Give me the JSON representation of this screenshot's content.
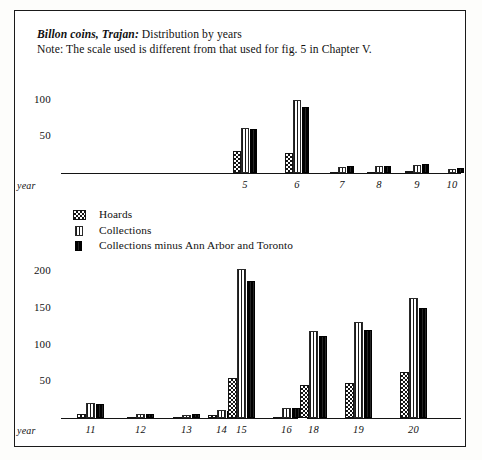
{
  "figure": {
    "title_italic": "Billon coins, Trajan:",
    "title_rest": " Distribution by years",
    "note": "Note: The scale used is different from that used for  fig. 5 in Chapter V."
  },
  "legend": {
    "items": [
      {
        "label": "Hoards",
        "pattern": "checkerboard",
        "color": "#151515"
      },
      {
        "label": "Collections",
        "pattern": "vertical-stripes",
        "color": "#1b1b1b"
      },
      {
        "label": "Collections minus Ann Arbor and Toronto",
        "pattern": "solid-dense",
        "color": "#101010"
      }
    ]
  },
  "axis_word": "year",
  "chart_data": [
    {
      "type": "bar",
      "title": "Billon coins, Trajan: Distribution by years (upper panel)",
      "panel": "upper",
      "xlabel": "year",
      "ylabel": "",
      "categories": [
        "5",
        "6",
        "7",
        "8",
        "9",
        "10"
      ],
      "yticks": [
        50,
        100
      ],
      "ylim": [
        0,
        115
      ],
      "grid": false,
      "legend_position": "below-panel",
      "series": [
        {
          "name": "Hoards",
          "values": [
            30,
            28,
            1,
            1,
            3,
            0
          ]
        },
        {
          "name": "Collections",
          "values": [
            62,
            100,
            8,
            9,
            11,
            6
          ]
        },
        {
          "name": "Collections minus Ann Arbor and Toronto",
          "values": [
            60,
            90,
            9,
            10,
            12,
            7
          ]
        }
      ]
    },
    {
      "type": "bar",
      "title": "Billon coins, Trajan: Distribution by years (lower panel)",
      "panel": "lower",
      "xlabel": "year",
      "ylabel": "",
      "categories": [
        "11",
        "12",
        "13",
        "14",
        "15",
        "16",
        "18",
        "19",
        "20"
      ],
      "yticks": [
        50,
        100,
        150,
        200
      ],
      "ylim": [
        0,
        215
      ],
      "grid": false,
      "note_axis_gap": "axis line is broken between year 16 and year 18 (year 17 omitted)",
      "series": [
        {
          "name": "Hoards",
          "values": [
            6,
            1,
            2,
            4,
            55,
            1,
            45,
            47,
            62
          ]
        },
        {
          "name": "Collections",
          "values": [
            21,
            5,
            4,
            11,
            203,
            13,
            118,
            130,
            163
          ]
        },
        {
          "name": "Collections minus Ann Arbor and Toronto",
          "values": [
            19,
            6,
            5,
            9,
            186,
            13,
            112,
            120,
            150
          ]
        }
      ]
    }
  ]
}
